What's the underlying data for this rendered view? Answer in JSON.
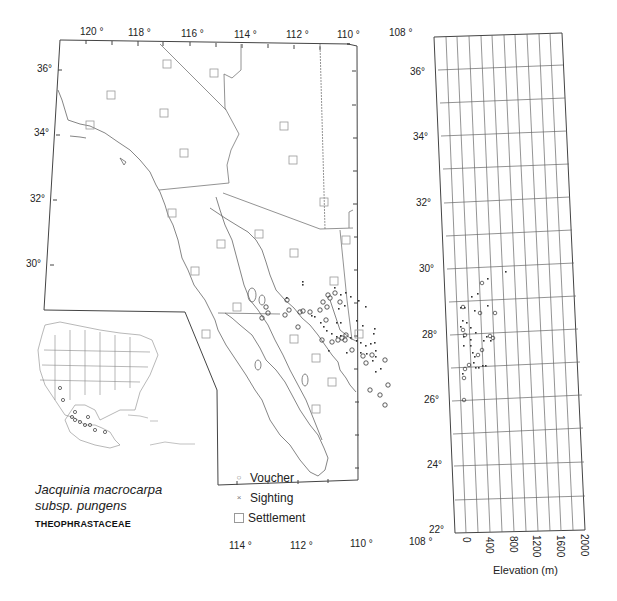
{
  "title": {
    "species_line1": "Jacquinia macrocarpa",
    "species_line2": "subsp. pungens",
    "family": "THEOPHRASTACEAE"
  },
  "legend": {
    "items": [
      {
        "symbol": "circle",
        "glyph": "○",
        "label": "Voucher"
      },
      {
        "symbol": "cross",
        "glyph": "×",
        "label": "Sighting"
      },
      {
        "symbol": "square",
        "glyph": "□",
        "label": "Settlement"
      }
    ]
  },
  "map": {
    "top_lon_labels": [
      "120 °",
      "118 °",
      "116 °",
      "114 °",
      "112 °",
      "110 °",
      "108 °"
    ],
    "bottom_lon_labels": [
      "114 °",
      "112 °",
      "110 °",
      "108 °"
    ],
    "left_lat_labels": [
      "36°",
      "34°",
      "32°",
      "30°"
    ],
    "right_lat_labels": [
      "36°",
      "34°",
      "32°",
      "30°",
      "28°",
      "26°",
      "24°",
      "22°"
    ]
  },
  "elevation_panel": {
    "xlabel": "Elevation (m)",
    "x_ticks": [
      "0",
      "400",
      "800",
      "1200",
      "1600",
      "2000"
    ],
    "lat_gridlines": 10,
    "elev_gridlines": 11
  },
  "colors": {
    "line": "#555555",
    "border": "#444444",
    "text": "#222222",
    "symbol": "#333333"
  }
}
